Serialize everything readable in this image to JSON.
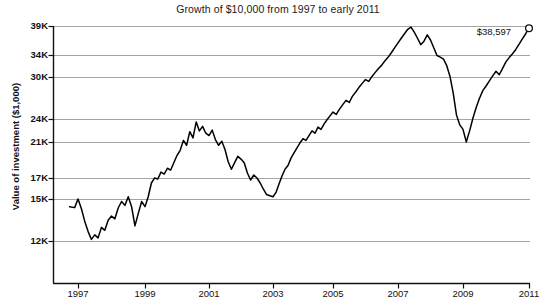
{
  "chart_data": {
    "type": "line",
    "title": "Growth of $10,000 from 1997 to early 2011",
    "xlabel": "",
    "ylabel": "Value of investment ($1,000)",
    "grid": true,
    "legend": null,
    "xlim": [
      1996.6,
      2011.1
    ],
    "ylim": [
      9500,
      39000
    ],
    "yscale": "log-like",
    "ytick_labels": [
      "39K",
      "34K",
      "30K",
      "24K",
      "21K",
      "17K",
      "15K",
      "12K"
    ],
    "ytick_values": [
      39000,
      34000,
      30000,
      24000,
      21000,
      17000,
      15000,
      12000
    ],
    "xtick_labels": [
      "1997",
      "1999",
      "2001",
      "2003",
      "2005",
      "2007",
      "2009",
      "2011"
    ],
    "xtick_values": [
      1997,
      1999,
      2001,
      2003,
      2005,
      2007,
      2009,
      2011
    ],
    "annotations": [
      {
        "text": "$38,597",
        "x": 2010.6,
        "y": 38597,
        "marker": "open-circle"
      }
    ],
    "series": [
      {
        "name": "Value of investment",
        "color": "#000000",
        "x": [
          1996.75,
          1996.9,
          1997.0,
          1997.1,
          1997.2,
          1997.3,
          1997.4,
          1997.5,
          1997.6,
          1997.7,
          1997.8,
          1997.9,
          1998.0,
          1998.1,
          1998.2,
          1998.3,
          1998.4,
          1998.5,
          1998.6,
          1998.7,
          1998.8,
          1998.9,
          1999.0,
          1999.1,
          1999.2,
          1999.3,
          1999.4,
          1999.5,
          1999.6,
          1999.7,
          1999.8,
          1999.9,
          2000.0,
          2000.1,
          2000.2,
          2000.3,
          2000.4,
          2000.5,
          2000.6,
          2000.7,
          2000.8,
          2000.9,
          2001.0,
          2001.1,
          2001.2,
          2001.3,
          2001.4,
          2001.5,
          2001.6,
          2001.7,
          2001.8,
          2001.9,
          2002.0,
          2002.1,
          2002.2,
          2002.3,
          2002.4,
          2002.5,
          2002.6,
          2002.7,
          2002.8,
          2002.9,
          2003.0,
          2003.1,
          2003.2,
          2003.3,
          2003.4,
          2003.5,
          2003.6,
          2003.7,
          2003.8,
          2003.9,
          2004.0,
          2004.1,
          2004.2,
          2004.3,
          2004.4,
          2004.5,
          2004.6,
          2004.7,
          2004.8,
          2004.9,
          2005.0,
          2005.1,
          2005.2,
          2005.3,
          2005.4,
          2005.5,
          2005.6,
          2005.7,
          2005.8,
          2005.9,
          2006.0,
          2006.1,
          2006.2,
          2006.3,
          2006.4,
          2006.5,
          2006.6,
          2006.7,
          2006.8,
          2006.9,
          2007.0,
          2007.1,
          2007.2,
          2007.3,
          2007.4,
          2007.5,
          2007.6,
          2007.7,
          2007.8,
          2007.9,
          2008.0,
          2008.1,
          2008.2,
          2008.3,
          2008.4,
          2008.5,
          2008.6,
          2008.7,
          2008.8,
          2008.9,
          2009.0,
          2009.1,
          2009.2,
          2009.3,
          2009.4,
          2009.5,
          2009.6,
          2009.7,
          2009.8,
          2009.9,
          2010.0,
          2010.1,
          2010.2,
          2010.3,
          2010.4,
          2010.5,
          2010.6,
          2010.7,
          2010.8,
          2010.9,
          2011.0,
          2010.95
        ],
        "y": [
          10000,
          10050,
          9600,
          10100,
          10800,
          11400,
          11900,
          12400,
          12200,
          12900,
          12700,
          13400,
          13700,
          13500,
          14300,
          14800,
          14500,
          15200,
          14400,
          13000,
          13900,
          14800,
          14400,
          15200,
          16500,
          17000,
          16900,
          17600,
          17400,
          18000,
          17800,
          18600,
          19400,
          20000,
          21200,
          20600,
          22300,
          21500,
          23600,
          22400,
          23000,
          22100,
          21800,
          22500,
          21300,
          20600,
          21100,
          20100,
          18700,
          17900,
          18600,
          19300,
          19000,
          18600,
          17500,
          16800,
          17300,
          17000,
          16500,
          15900,
          15400,
          15300,
          15200,
          15600,
          16400,
          17200,
          17900,
          18300,
          19100,
          19700,
          20300,
          20900,
          21400,
          21200,
          21800,
          22400,
          22100,
          22900,
          22600,
          23300,
          23900,
          24400,
          24900,
          24600,
          25300,
          25900,
          26500,
          26200,
          27100,
          27700,
          28400,
          29000,
          29600,
          29300,
          30100,
          30800,
          31500,
          32100,
          32900,
          33600,
          34400,
          35200,
          36000,
          36800,
          37600,
          38400,
          38800,
          37900,
          36800,
          35700,
          36300,
          37400,
          36500,
          35200,
          33900,
          33600,
          33200,
          32000,
          30100,
          27500,
          24500,
          23200,
          22600,
          21000,
          22400,
          24100,
          25500,
          26800,
          27900,
          28600,
          29400,
          30200,
          31000,
          30400,
          31500,
          32700,
          33500,
          34200,
          34900,
          35800,
          36700,
          37600,
          38597,
          38200
        ]
      }
    ]
  }
}
